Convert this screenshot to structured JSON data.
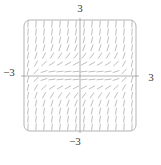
{
  "figure": {
    "kind": "slope-field-plot",
    "labels": {
      "top": "3",
      "right": "3",
      "left": "−3",
      "bottom": "−3"
    }
  },
  "chart_data": {
    "type": "vector_field",
    "subtype": "slope_field",
    "title": "",
    "xlabel": "",
    "ylabel": "",
    "x_range": [
      -3,
      3
    ],
    "y_range": [
      -3,
      3
    ],
    "axes_cross": [
      0,
      0
    ],
    "x_tick_labels": [
      "−3",
      "3"
    ],
    "y_tick_labels": [
      "−3",
      "3"
    ],
    "grid_points": [
      14,
      14
    ],
    "frame": true,
    "frame_rounded": true,
    "gridlines": false,
    "legend": false,
    "slope_model": {
      "description": "estimated slope dy/dx depicted by dashes; flat band along x-axis, near-vertical at top/bottom center and side edges, positive moderate slopes on diagonals",
      "coefficients": {
        "x8": 0.001,
        "y2": 1.15,
        "x2y2": 0.1,
        "const": 0.05
      }
    },
    "style": {
      "frame_color": "#b3b3b3",
      "axis_color": "#8f8f8f",
      "dash_color": "#a9a9a9",
      "label_color": "#3d3d3d",
      "background": "#ffffff",
      "dash_length_px": 7,
      "dash_width_px": 0.75
    }
  }
}
